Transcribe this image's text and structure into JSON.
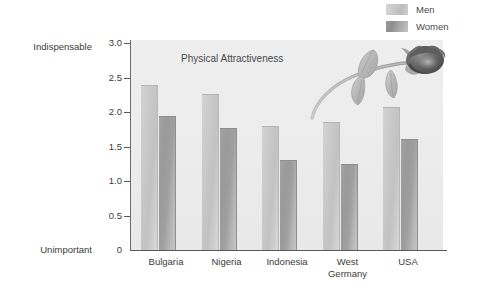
{
  "legend": {
    "items": [
      {
        "label": "Men",
        "swatch": "men-swatch",
        "color": "#c9c9c9"
      },
      {
        "label": "Women",
        "swatch": "women-swatch",
        "color": "#9a9a9a"
      }
    ]
  },
  "axis": {
    "top_label": "Indispensable",
    "bottom_label": "Unimportant",
    "ticks": [
      "3.0",
      "2.5",
      "2.0",
      "1.5",
      "1.0",
      "0.5",
      "0"
    ]
  },
  "decoration": {
    "icon": "rose-icon"
  },
  "chart_data": {
    "type": "bar",
    "title": "Physical Attractiveness",
    "xlabel": "",
    "ylabel": "",
    "ylim": [
      0,
      3.0
    ],
    "yticks": [
      0,
      0.5,
      1.0,
      1.5,
      2.0,
      2.5,
      3.0
    ],
    "ytick_labels": [
      "0",
      "0.5",
      "1.0",
      "1.5",
      "2.0",
      "2.5",
      "3.0"
    ],
    "y_axis_endpoints": {
      "min": "Unimportant",
      "max": "Indispensable"
    },
    "grid": false,
    "legend_position": "top-right",
    "categories": [
      "Bulgaria",
      "Nigeria",
      "Indonesia",
      "West\nGermany",
      "USA"
    ],
    "series": [
      {
        "name": "Men",
        "values": [
          2.4,
          2.28,
          1.81,
          1.87,
          2.08
        ]
      },
      {
        "name": "Women",
        "values": [
          1.96,
          1.79,
          1.32,
          1.26,
          1.62
        ]
      }
    ]
  }
}
